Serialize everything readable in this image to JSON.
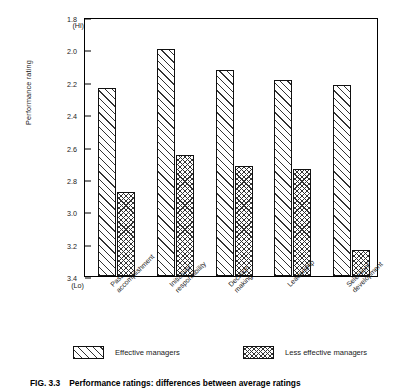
{
  "figure": {
    "caption_number": "FIG. 3.3",
    "caption_text": "Performance ratings: differences between average ratings"
  },
  "chart_data": {
    "type": "bar",
    "title": "",
    "xlabel": "",
    "ylabel": "Performance rating",
    "categories": [
      "Past accomplishment",
      "Initiative/ responsibility",
      "Decision making",
      "Leadership",
      "Selection/ development"
    ],
    "category_lines": [
      [
        "Past",
        "accomplishment"
      ],
      [
        "Initiative/",
        "responsibility"
      ],
      [
        "Decision",
        "making"
      ],
      [
        "Leadership",
        ""
      ],
      [
        "Selection/",
        "development"
      ]
    ],
    "series": [
      {
        "name": "Effective managers",
        "pattern": "diagonal-hatch",
        "values": [
          2.24,
          2.0,
          2.13,
          2.19,
          2.22
        ]
      },
      {
        "name": "Less effective managers",
        "pattern": "cross-hatch",
        "values": [
          2.88,
          2.65,
          2.72,
          2.74,
          3.24
        ]
      }
    ],
    "yaxis": {
      "inverted": true,
      "top_label": "(Hi)",
      "bottom_label": "(Lo)",
      "ticks": [
        "1.8",
        "2.0",
        "2.2",
        "2.4",
        "2.6",
        "2.8",
        "3.0",
        "3.2",
        "3.4"
      ],
      "ylim": [
        1.8,
        3.4
      ],
      "baseline": 3.4,
      "grid": false
    },
    "legend": {
      "position": "bottom",
      "entries": [
        {
          "label": "Effective managers",
          "pattern": "diagonal-hatch"
        },
        {
          "label": "Less effective managers",
          "pattern": "cross-hatch"
        }
      ]
    },
    "colors": {
      "axis": "#000000",
      "text": "#1a1a1a",
      "hatch": "#333333",
      "background": "#ffffff"
    }
  }
}
